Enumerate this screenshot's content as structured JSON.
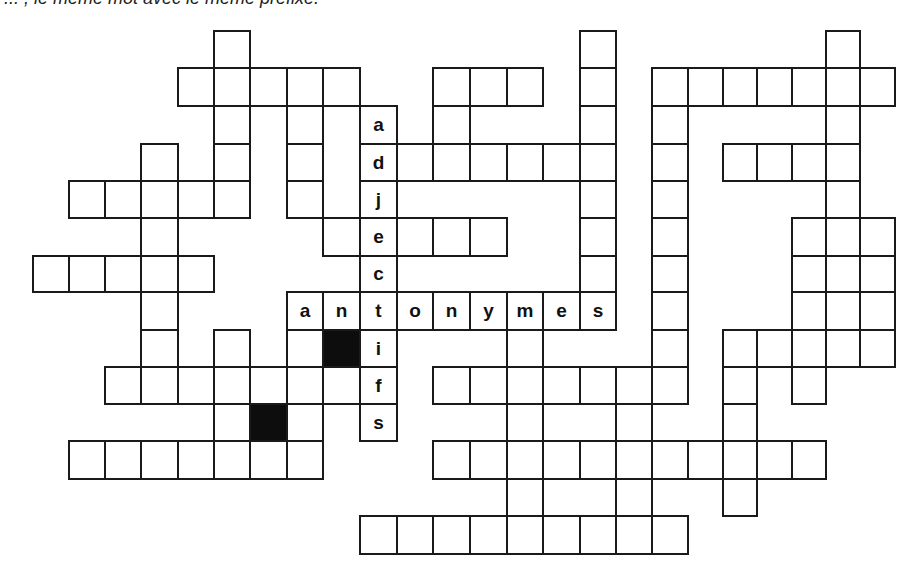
{
  "header": {
    "text": "... , le même mot avec le même préfixe."
  },
  "colors": {
    "line": "#1a1a1a",
    "block": "#0d0d0d",
    "background": "#ffffff"
  },
  "geometry": {
    "cols": [
      33,
      69,
      105,
      141,
      178,
      214,
      250,
      287,
      323,
      360,
      397,
      433,
      470,
      507,
      543,
      580,
      616,
      652,
      688,
      723,
      757,
      792,
      826,
      860,
      895
    ],
    "rows": [
      31,
      68,
      106,
      144,
      181,
      218,
      256,
      292,
      330,
      367,
      404,
      441,
      479,
      516,
      554
    ]
  },
  "puzzle": {
    "across_word": {
      "label": "antonymes",
      "row": 7,
      "start_col": 7
    },
    "down_word": {
      "label": "adjectifs",
      "col": 9,
      "start_row": 2
    },
    "cells": [
      [
        0,
        5
      ],
      [
        0,
        15
      ],
      [
        0,
        22
      ],
      [
        1,
        4
      ],
      [
        1,
        5
      ],
      [
        1,
        6
      ],
      [
        1,
        7
      ],
      [
        1,
        8
      ],
      [
        1,
        11
      ],
      [
        1,
        12
      ],
      [
        1,
        13
      ],
      [
        1,
        15
      ],
      [
        1,
        17
      ],
      [
        1,
        18
      ],
      [
        1,
        19
      ],
      [
        1,
        20
      ],
      [
        1,
        21
      ],
      [
        1,
        22
      ],
      [
        1,
        23
      ],
      [
        2,
        5
      ],
      [
        2,
        7
      ],
      [
        2,
        9,
        "a"
      ],
      [
        2,
        11
      ],
      [
        2,
        15
      ],
      [
        2,
        17
      ],
      [
        2,
        22
      ],
      [
        3,
        3
      ],
      [
        3,
        5
      ],
      [
        3,
        7
      ],
      [
        3,
        9,
        "d"
      ],
      [
        3,
        10
      ],
      [
        3,
        11
      ],
      [
        3,
        12
      ],
      [
        3,
        13
      ],
      [
        3,
        14
      ],
      [
        3,
        15
      ],
      [
        3,
        17
      ],
      [
        3,
        19
      ],
      [
        3,
        20
      ],
      [
        3,
        21
      ],
      [
        3,
        22
      ],
      [
        4,
        1
      ],
      [
        4,
        2
      ],
      [
        4,
        3
      ],
      [
        4,
        4
      ],
      [
        4,
        5
      ],
      [
        4,
        7
      ],
      [
        4,
        9,
        "j"
      ],
      [
        4,
        15
      ],
      [
        4,
        17
      ],
      [
        4,
        22
      ],
      [
        5,
        3
      ],
      [
        5,
        8
      ],
      [
        5,
        9,
        "e"
      ],
      [
        5,
        10
      ],
      [
        5,
        11
      ],
      [
        5,
        12
      ],
      [
        5,
        15
      ],
      [
        5,
        17
      ],
      [
        5,
        21
      ],
      [
        5,
        22
      ],
      [
        5,
        23
      ],
      [
        6,
        0
      ],
      [
        6,
        1
      ],
      [
        6,
        2
      ],
      [
        6,
        3
      ],
      [
        6,
        4
      ],
      [
        6,
        9,
        "c"
      ],
      [
        6,
        15
      ],
      [
        6,
        17
      ],
      [
        6,
        21
      ],
      [
        6,
        22
      ],
      [
        6,
        23
      ],
      [
        7,
        3
      ],
      [
        7,
        7,
        "a"
      ],
      [
        7,
        8,
        "n"
      ],
      [
        7,
        9,
        "t"
      ],
      [
        7,
        10,
        "o"
      ],
      [
        7,
        11,
        "n"
      ],
      [
        7,
        12,
        "y"
      ],
      [
        7,
        13,
        "m"
      ],
      [
        7,
        14,
        "e"
      ],
      [
        7,
        15,
        "s"
      ],
      [
        7,
        17
      ],
      [
        7,
        21
      ],
      [
        7,
        22
      ],
      [
        7,
        23
      ],
      [
        8,
        3
      ],
      [
        8,
        5
      ],
      [
        8,
        7
      ],
      [
        8,
        8,
        "#"
      ],
      [
        8,
        9,
        "i"
      ],
      [
        8,
        13
      ],
      [
        8,
        17
      ],
      [
        8,
        19
      ],
      [
        8,
        20
      ],
      [
        8,
        21
      ],
      [
        8,
        22
      ],
      [
        8,
        23
      ],
      [
        9,
        2
      ],
      [
        9,
        3
      ],
      [
        9,
        4
      ],
      [
        9,
        5
      ],
      [
        9,
        6
      ],
      [
        9,
        7
      ],
      [
        9,
        8
      ],
      [
        9,
        9,
        "f"
      ],
      [
        9,
        11
      ],
      [
        9,
        12
      ],
      [
        9,
        13
      ],
      [
        9,
        14
      ],
      [
        9,
        15
      ],
      [
        9,
        16
      ],
      [
        9,
        17
      ],
      [
        9,
        19
      ],
      [
        9,
        21
      ],
      [
        10,
        5
      ],
      [
        10,
        6,
        "#"
      ],
      [
        10,
        7
      ],
      [
        10,
        9,
        "s"
      ],
      [
        10,
        13
      ],
      [
        10,
        16
      ],
      [
        10,
        19
      ],
      [
        11,
        1
      ],
      [
        11,
        2
      ],
      [
        11,
        3
      ],
      [
        11,
        4
      ],
      [
        11,
        5
      ],
      [
        11,
        6
      ],
      [
        11,
        7
      ],
      [
        11,
        11
      ],
      [
        11,
        12
      ],
      [
        11,
        13
      ],
      [
        11,
        14
      ],
      [
        11,
        15
      ],
      [
        11,
        16
      ],
      [
        11,
        17
      ],
      [
        11,
        18
      ],
      [
        11,
        19
      ],
      [
        11,
        20
      ],
      [
        11,
        21
      ],
      [
        12,
        13
      ],
      [
        12,
        16
      ],
      [
        12,
        19
      ],
      [
        13,
        9
      ],
      [
        13,
        10
      ],
      [
        13,
        11
      ],
      [
        13,
        12
      ],
      [
        13,
        13
      ],
      [
        13,
        14
      ],
      [
        13,
        15
      ],
      [
        13,
        16
      ],
      [
        13,
        17
      ]
    ]
  }
}
